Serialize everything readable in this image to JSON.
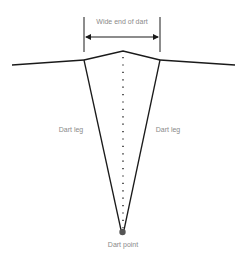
{
  "diagram": {
    "labels": {
      "wide_end": "Wide end of dart",
      "leg_left": "Dart leg",
      "leg_right": "Dart leg",
      "point": "Dart point"
    },
    "colors": {
      "line": "#1a1a1a",
      "label": "#8a8a8a",
      "point": "#555555"
    }
  }
}
